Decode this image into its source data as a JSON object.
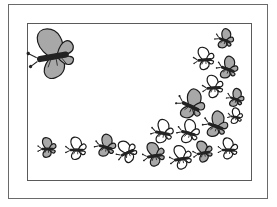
{
  "illustration": {
    "subject": "butterflies",
    "colors": {
      "outline": "#1a1a1a",
      "body": "#222222",
      "fill_gray": "#a8a8a8",
      "fill_white": "#ffffff",
      "frame": "#5a5a5a"
    },
    "butterflies": [
      {
        "x": 52,
        "y": 57,
        "s": 1.9,
        "r": -10,
        "fill": "gray"
      },
      {
        "x": 224,
        "y": 40,
        "s": 0.75,
        "r": 20,
        "fill": "gray"
      },
      {
        "x": 204,
        "y": 60,
        "s": 0.85,
        "r": -5,
        "fill": "white"
      },
      {
        "x": 227,
        "y": 69,
        "s": 0.85,
        "r": 20,
        "fill": "gray"
      },
      {
        "x": 213,
        "y": 88,
        "s": 0.85,
        "r": -5,
        "fill": "white"
      },
      {
        "x": 235,
        "y": 99,
        "s": 0.7,
        "r": 20,
        "fill": "gray"
      },
      {
        "x": 190,
        "y": 106,
        "s": 1.15,
        "r": 25,
        "fill": "gray"
      },
      {
        "x": 235,
        "y": 117,
        "s": 0.6,
        "r": 10,
        "fill": "white"
      },
      {
        "x": 215,
        "y": 126,
        "s": 1.0,
        "r": 20,
        "fill": "gray"
      },
      {
        "x": 162,
        "y": 133,
        "s": 0.9,
        "r": 10,
        "fill": "white"
      },
      {
        "x": 188,
        "y": 133,
        "s": 0.9,
        "r": 15,
        "fill": "white"
      },
      {
        "x": 47,
        "y": 149,
        "s": 0.75,
        "r": 0,
        "fill": "gray"
      },
      {
        "x": 76,
        "y": 150,
        "s": 0.85,
        "r": 0,
        "fill": "white"
      },
      {
        "x": 105,
        "y": 147,
        "s": 0.85,
        "r": 15,
        "fill": "gray"
      },
      {
        "x": 127,
        "y": 153,
        "s": 0.85,
        "r": -25,
        "fill": "white"
      },
      {
        "x": 154,
        "y": 156,
        "s": 0.9,
        "r": -10,
        "fill": "gray"
      },
      {
        "x": 181,
        "y": 159,
        "s": 0.9,
        "r": -10,
        "fill": "white"
      },
      {
        "x": 203,
        "y": 153,
        "s": 0.8,
        "r": -10,
        "fill": "gray"
      },
      {
        "x": 228,
        "y": 150,
        "s": 0.8,
        "r": 0,
        "fill": "white"
      }
    ]
  }
}
